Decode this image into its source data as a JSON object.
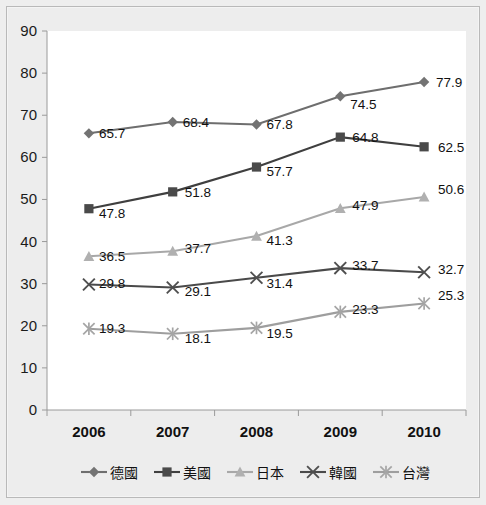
{
  "chart_data": {
    "type": "line",
    "title": "",
    "subtitle": "",
    "xlabel": "",
    "ylabel": "",
    "categories": [
      "2006",
      "2007",
      "2008",
      "2009",
      "2010"
    ],
    "ylim": [
      0,
      90
    ],
    "ytick_step": 10,
    "yticks": [
      "0",
      "10",
      "20",
      "30",
      "40",
      "50",
      "60",
      "70",
      "80",
      "90"
    ],
    "grid": false,
    "legend_position": "bottom",
    "series": [
      {
        "name": "德國",
        "marker": "diamond",
        "color": "#737373",
        "line_color": "#6e6e6e",
        "values": [
          65.7,
          68.4,
          67.8,
          74.5,
          77.9
        ],
        "labels": [
          "65.7",
          "68.4",
          "67.8",
          "74.5",
          "77.9"
        ]
      },
      {
        "name": "美國",
        "marker": "square",
        "color": "#4a4a4a",
        "line_color": "#3f3f3f",
        "values": [
          47.8,
          51.8,
          57.7,
          64.8,
          62.5
        ],
        "labels": [
          "47.8",
          "51.8",
          "57.7",
          "64.8",
          "62.5"
        ]
      },
      {
        "name": "日本",
        "marker": "triangle",
        "color": "#b0b0b0",
        "line_color": "#a8a8a8",
        "values": [
          36.5,
          37.7,
          41.3,
          47.9,
          50.6
        ],
        "labels": [
          "36.5",
          "37.7",
          "41.3",
          "47.9",
          "50.6"
        ]
      },
      {
        "name": "韓國",
        "marker": "x",
        "color": "#4f4f4f",
        "line_color": "#4a4a4a",
        "values": [
          29.8,
          29.1,
          31.4,
          33.7,
          32.7
        ],
        "labels": [
          "29.8",
          "29.1",
          "31.4",
          "33.7",
          "32.7"
        ]
      },
      {
        "name": "台灣",
        "marker": "asterisk",
        "color": "#a5a5a5",
        "line_color": "#9e9e9e",
        "values": [
          19.3,
          18.1,
          19.5,
          23.3,
          25.3
        ],
        "labels": [
          "19.3",
          "18.1",
          "19.5",
          "23.3",
          "25.3"
        ]
      }
    ]
  },
  "colors": {
    "page_background": "#eeeeee",
    "frame_background": "#ededed",
    "plot_background": "#ffffff",
    "axis": "#9a9a9a",
    "text": "#111111"
  },
  "label_offsets": {
    "德國": [
      [
        10,
        5
      ],
      [
        10,
        5
      ],
      [
        10,
        5
      ],
      [
        10,
        13
      ],
      [
        12,
        5
      ]
    ],
    "美國": [
      [
        10,
        9
      ],
      [
        12,
        5
      ],
      [
        10,
        9
      ],
      [
        12,
        5
      ],
      [
        14,
        5
      ]
    ],
    "日本": [
      [
        10,
        5
      ],
      [
        12,
        2
      ],
      [
        10,
        9
      ],
      [
        12,
        2
      ],
      [
        14,
        -3
      ]
    ],
    "韓國": [
      [
        10,
        3
      ],
      [
        12,
        9
      ],
      [
        10,
        10
      ],
      [
        12,
        2
      ],
      [
        14,
        2
      ]
    ],
    "台灣": [
      [
        10,
        4
      ],
      [
        12,
        9
      ],
      [
        10,
        10
      ],
      [
        12,
        2
      ],
      [
        14,
        -3
      ]
    ]
  }
}
